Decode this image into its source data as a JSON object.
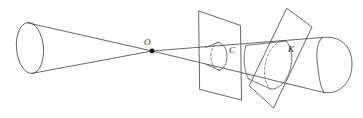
{
  "figure": {
    "background_color": "#ffffff",
    "line_color": "#4a4a4a",
    "label_color": "#1a1a1a",
    "width": 363,
    "height": 118,
    "labels": {
      "apex": "O",
      "circle_section": "C",
      "ellipse_section": "K"
    },
    "elements": {
      "apex_point_name": "apex-vertex-o",
      "left_nappe_name": "left-cone-nappe",
      "right_nappe_name": "right-cone-nappe",
      "plane_one_name": "vertical-cutting-plane",
      "plane_two_name": "tilted-cutting-plane",
      "section_c_name": "conic-section-circle-c",
      "section_k_name": "conic-section-ellipse-k"
    },
    "geometry": {
      "apex": [
        152,
        51
      ],
      "left_base_ellipse": {
        "cx": 30,
        "cy": 48,
        "rx": 14,
        "ry": 26,
        "rotation": -6
      },
      "upper_generator_left": [
        [
          28,
          22
        ],
        [
          152,
          51
        ]
      ],
      "lower_generator_left": [
        [
          32,
          74
        ],
        [
          152,
          51
        ]
      ],
      "upper_generator_right": [
        [
          152,
          51
        ],
        [
          352,
          36
        ]
      ],
      "lower_generator_right": [
        [
          152,
          51
        ],
        [
          340,
          95
        ]
      ],
      "plane_one_corners": [
        [
          199,
          11
        ],
        [
          240,
          26
        ],
        [
          241,
          100
        ],
        [
          200,
          90
        ]
      ],
      "plane_two_corners": [
        [
          287,
          9
        ],
        [
          312,
          27
        ],
        [
          273,
          108
        ],
        [
          250,
          86
        ]
      ],
      "section_c_ellipse": {
        "cx": 219,
        "cy": 56,
        "rx": 7,
        "ry": 14,
        "rotation": -3
      },
      "section_k_ellipse": {
        "cx": 279,
        "cy": 63,
        "rx": 13,
        "ry": 25,
        "rotation": -18
      },
      "right_base_ellipse": {
        "cx": 336,
        "cy": 64,
        "rx": 16,
        "ry": 29,
        "rotation": -7
      },
      "label_positions": {
        "apex": [
          145,
          44
        ],
        "circle_section": [
          231,
          51
        ],
        "ellipse_section": [
          291,
          50
        ]
      }
    }
  }
}
